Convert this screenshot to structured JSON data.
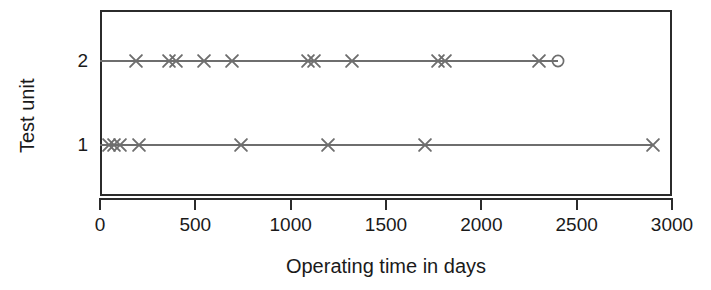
{
  "chart": {
    "type": "event-plot",
    "x_axis_title": "Operating time in days",
    "y_axis_title": "Test unit",
    "x_ticks": [
      "0",
      "500",
      "1000",
      "1500",
      "2000",
      "2500",
      "3000"
    ],
    "y_ticks": [
      "2",
      "1"
    ],
    "marker_event": "x-cross-marker",
    "marker_censored": "open-circle-marker",
    "line_color": "#6e6e6e",
    "axis_color": "#2b2b2b"
  },
  "chart_data": {
    "type": "scatter",
    "title": "",
    "subtitle": "",
    "xlabel": "Operating time in days",
    "ylabel": "Test unit",
    "xlim": [
      0,
      3000
    ],
    "ylim": [
      0.4,
      2.6
    ],
    "xticks": [
      0,
      500,
      1000,
      1500,
      2000,
      2500,
      3000
    ],
    "yticks": [
      1,
      2
    ],
    "ytick_labels": [
      "1",
      "2"
    ],
    "grid": false,
    "legend": null,
    "series": [
      {
        "name": "Test unit 2",
        "y": 2,
        "marker": "x",
        "line_start": 0,
        "line_end": 2400,
        "values": [
          187,
          363,
          396,
          544,
          692,
          1090,
          1120,
          1320,
          1775,
          1808,
          2300
        ],
        "censored": {
          "value": 2400,
          "marker": "o"
        }
      },
      {
        "name": "Test unit 1",
        "y": 1,
        "marker": "x",
        "line_start": 0,
        "line_end": 2900,
        "values": [
          45,
          75,
          105,
          205,
          742,
          1198,
          1703,
          2900
        ],
        "censored": null
      }
    ]
  }
}
